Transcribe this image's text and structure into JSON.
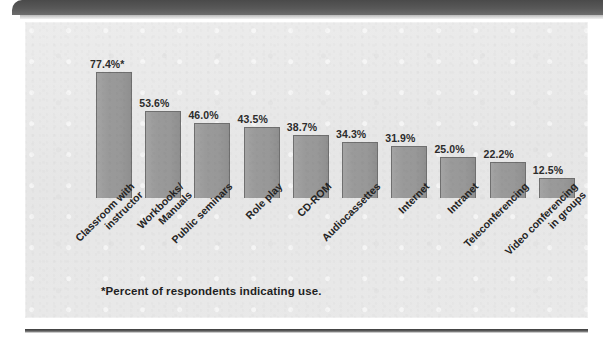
{
  "chart_data": {
    "type": "bar",
    "title": "",
    "subtitle": "",
    "xlabel": "",
    "ylabel": "",
    "ylim": [
      0,
      80
    ],
    "grid": false,
    "legend": "none",
    "orientation": "vertical",
    "value_suffix": "%",
    "categories": [
      "Classroom with\ninstructor",
      "Workbooks/\nManuals",
      "Public seminars",
      "Role play",
      "CD-ROM",
      "Audiocassettes",
      "Internet",
      "Intranet",
      "Teleconferencing",
      "Video conferencing\nin groups"
    ],
    "values": [
      77.4,
      53.6,
      46.0,
      43.5,
      38.7,
      34.3,
      31.9,
      25.0,
      22.2,
      12.5
    ],
    "value_labels": [
      "77.4%*",
      "53.6%",
      "46.0%",
      "43.5%",
      "38.7%",
      "34.3%",
      "31.9%",
      "25.0%",
      "22.2%",
      "12.5%"
    ],
    "annotations": [
      "*Percent of respondents indicating use."
    ]
  },
  "figure": {
    "footnote": "*Percent of respondents indicating use.",
    "bar_color": "#9a9a9a",
    "bar_border_color": "#6f6f6f",
    "panel_background": "#e9e9e9",
    "label_color": "#242424",
    "top_band_color": "#585858",
    "rule_color": "#3c3c3c"
  }
}
